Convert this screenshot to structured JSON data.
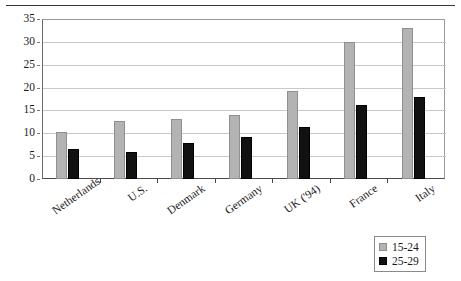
{
  "chart_data": {
    "type": "bar",
    "title": "",
    "title_clipped": true,
    "subtitle": "",
    "xlabel": "",
    "ylabel": "",
    "categories": [
      "Netherlands",
      "U.S.",
      "Denmark",
      "Germany",
      "UK ('94)",
      "France",
      "Italy"
    ],
    "series": [
      {
        "name": "15-24",
        "color": "#b3b3b3",
        "values": [
          10.2,
          12.7,
          13.1,
          14.0,
          19.2,
          29.9,
          33.0
        ]
      },
      {
        "name": "25-29",
        "color": "#111111",
        "values": [
          6.6,
          6.0,
          7.8,
          9.3,
          11.3,
          16.1,
          17.9
        ]
      }
    ],
    "ylim": [
      0,
      35
    ],
    "yticks": [
      0,
      5,
      10,
      15,
      20,
      25,
      30,
      35
    ],
    "ytick_labels": [
      "0",
      "5",
      "10",
      "15",
      "20",
      "25",
      "30",
      "35"
    ],
    "grid": true,
    "grid_axis": "y",
    "legend_position": "bottom-right",
    "bar_count_per_group": 2
  },
  "legend": {
    "items": [
      {
        "label": "15-24",
        "color": "#b3b3b3"
      },
      {
        "label": "25-29",
        "color": "#111111"
      }
    ]
  },
  "colors": {
    "series_15_24": "#b3b3b3",
    "series_25_29": "#111111",
    "gridline": "#c9c9c9",
    "axis": "#4a4a4a",
    "background": "#ffffff"
  }
}
